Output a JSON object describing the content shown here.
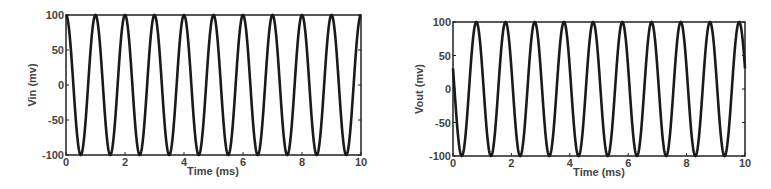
{
  "chart_data": [
    {
      "type": "line",
      "title": "",
      "xlabel": "Time (ms)",
      "ylabel": "Vin (mv)",
      "xlim": [
        0,
        10
      ],
      "ylim": [
        -100,
        100
      ],
      "xticks": [
        0,
        2,
        4,
        6,
        8,
        10
      ],
      "yticks": [
        -100,
        -50,
        0,
        50,
        100
      ],
      "grid": false,
      "legend": null,
      "description": "1 kHz sinusoid, amplitude 100 mV, peaks at t = 0,1,2,...,10 ms, troughs at 0.5,1.5,...,9.5 ms",
      "series": [
        {
          "name": "Vin",
          "amplitude": 100,
          "frequency_khz": 1,
          "peak_times_ms": [
            0,
            1,
            2,
            3,
            4,
            5,
            6,
            7,
            8,
            9,
            10
          ],
          "trough_times_ms": [
            0.5,
            1.5,
            2.5,
            3.5,
            4.5,
            5.5,
            6.5,
            7.5,
            8.5,
            9.5
          ],
          "x": [
            0,
            0.25,
            0.5,
            0.75,
            1,
            1.25,
            1.5,
            1.75,
            2,
            2.5,
            3,
            3.5,
            4,
            4.5,
            5,
            5.5,
            6,
            6.5,
            7,
            7.5,
            8,
            8.5,
            9,
            9.5,
            10
          ],
          "y": [
            100,
            0,
            -100,
            0,
            100,
            0,
            -100,
            0,
            100,
            -100,
            100,
            -100,
            100,
            -100,
            100,
            -100,
            100,
            -100,
            100,
            -100,
            100,
            -100,
            100,
            -100,
            100
          ]
        }
      ]
    },
    {
      "type": "line",
      "title": "",
      "xlabel": "Time (ms)",
      "ylabel": "Vout (mv)",
      "xlim": [
        0,
        10
      ],
      "ylim": [
        -100,
        100
      ],
      "xticks": [
        0,
        2,
        4,
        6,
        8,
        10
      ],
      "yticks": [
        -100,
        -50,
        0,
        50,
        100
      ],
      "grid": false,
      "legend": null,
      "description": "1 kHz sinusoid, amplitude 100 mV, phase-shifted; starts near 0 at t=0 falling, troughs at ~0.3,1.3,...,9.3 ms, peaks at ~0.8,1.8,...,9.8 ms",
      "series": [
        {
          "name": "Vout",
          "amplitude": 100,
          "frequency_khz": 1,
          "peak_times_ms": [
            0.8,
            1.8,
            2.8,
            3.8,
            4.8,
            5.8,
            6.8,
            7.8,
            8.8,
            9.8
          ],
          "trough_times_ms": [
            0.3,
            1.3,
            2.3,
            3.3,
            4.3,
            5.3,
            6.3,
            7.3,
            8.3,
            9.3
          ],
          "x": [
            0,
            0.3,
            0.8,
            1.3,
            1.8,
            2.3,
            2.8,
            3.3,
            3.8,
            4.3,
            4.8,
            5.3,
            5.8,
            6.3,
            6.8,
            7.3,
            7.8,
            8.3,
            8.8,
            9.3,
            9.8,
            10
          ],
          "y": [
            0,
            -100,
            100,
            -100,
            100,
            -100,
            100,
            -100,
            100,
            -100,
            100,
            -100,
            100,
            -100,
            100,
            -100,
            100,
            -100,
            100,
            -100,
            100,
            80
          ]
        }
      ]
    }
  ],
  "charts": [
    {
      "ylabel": "Vin (mv)",
      "xlabel": "Time (ms)",
      "xticklabels": [
        "0",
        "2",
        "4",
        "6",
        "8",
        "10"
      ],
      "yticklabels": [
        "-100",
        "-50",
        "0",
        "50",
        "100"
      ]
    },
    {
      "ylabel": "Vout (mv)",
      "xlabel": "Time (ms)",
      "xticklabels": [
        "0",
        "2",
        "4",
        "6",
        "8",
        "10"
      ],
      "yticklabels": [
        "-100",
        "-50",
        "0",
        "50",
        "100"
      ]
    }
  ]
}
